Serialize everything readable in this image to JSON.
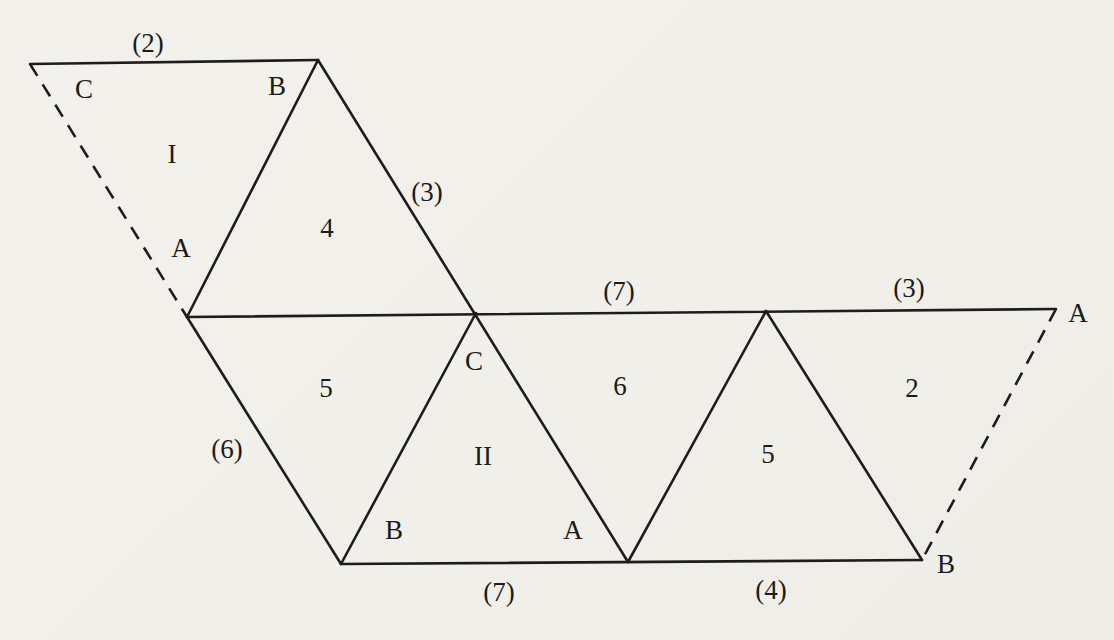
{
  "colors": {
    "paper": "#f2f0eb",
    "ink": "#1e1d1b"
  },
  "figure": {
    "edge_labels": {
      "top": "(2)",
      "upper_diagonal": "(3)",
      "middle_left": "(7)",
      "middle_right": "(3)",
      "left_diagonal": "(6)",
      "bottom_left": "(7)",
      "bottom_right": "(4)"
    },
    "face_labels": {
      "triangle_one": "I",
      "triangle_4": "4",
      "triangle_5_upper": "5",
      "triangle_two": "II",
      "triangle_6": "6",
      "triangle_5_lower": "5",
      "triangle_2": "2"
    },
    "vertex_labels": {
      "one_c": "C",
      "one_b": "B",
      "one_a": "A",
      "two_c": "C",
      "two_b": "B",
      "two_a": "A",
      "right_top": "A",
      "right_bottom": "B"
    }
  }
}
